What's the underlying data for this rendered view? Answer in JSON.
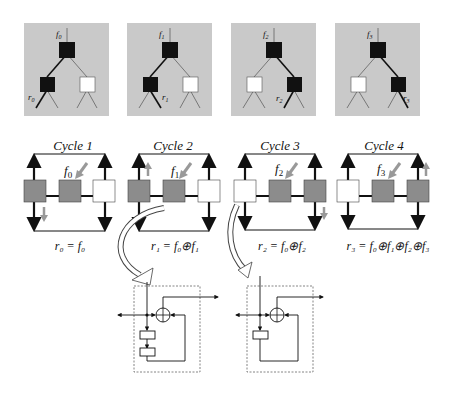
{
  "colors": {
    "panel_bg": "#c9c9c9",
    "node_active": "#111111",
    "node_inactive": "#ffffff",
    "cell_gray": "#8c8c8c",
    "hint_arrow": "#999999",
    "line": "#111111"
  },
  "trees": [
    {
      "root_label": "f",
      "root_sub": "0",
      "leaf_label": "r",
      "leaf_sub": "0",
      "path": "left-left"
    },
    {
      "root_label": "f",
      "root_sub": "1",
      "leaf_label": "r",
      "leaf_sub": "1",
      "path": "left-right"
    },
    {
      "root_label": "f",
      "root_sub": "2",
      "leaf_label": "r",
      "leaf_sub": "2",
      "path": "right-left"
    },
    {
      "root_label": "f",
      "root_sub": "3",
      "leaf_label": "r",
      "leaf_sub": "3",
      "path": "right-right"
    }
  ],
  "cycles": [
    {
      "title": "Cycle 1",
      "input_label": "f",
      "input_sub": "0",
      "equation": "r₀ = f₀",
      "cells": [
        "gray",
        "gray",
        "white"
      ],
      "hint": "down-left"
    },
    {
      "title": "Cycle 2",
      "input_label": "f",
      "input_sub": "1",
      "equation": "r₁ = f₀⊕f₁",
      "cells": [
        "gray",
        "gray",
        "white"
      ],
      "hint": "up-left"
    },
    {
      "title": "Cycle 3",
      "input_label": "f",
      "input_sub": "2",
      "equation": "r₂ = f₀⊕f₂",
      "cells": [
        "white",
        "gray",
        "gray"
      ],
      "hint": "down-right"
    },
    {
      "title": "Cycle 4",
      "input_label": "f",
      "input_sub": "3",
      "equation": "r₃ = f₀⊕f₁⊕f₂⊕f₃",
      "cells": [
        "white",
        "gray",
        "gray"
      ],
      "hint": "up-right"
    }
  ],
  "details": [
    {
      "name": "two-register-cell",
      "registers": 2,
      "operator": "⊕"
    },
    {
      "name": "one-register-cell",
      "registers": 1,
      "operator": "⊕"
    }
  ]
}
